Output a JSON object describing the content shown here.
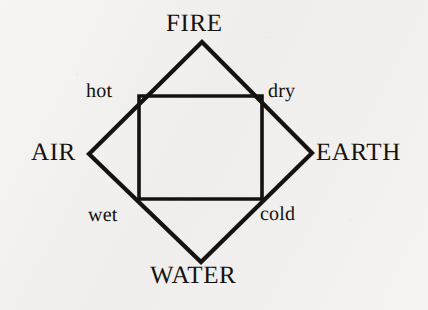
{
  "figure": {
    "background_color": "#f3f2f0",
    "ink_color": "#15120f"
  },
  "diagram": {
    "type": "diamond-in-square",
    "outer_shape": "diamond",
    "inner_shape": "square",
    "stroke_color": "#15120f",
    "outer_stroke_width": 4.2,
    "inner_stroke_width": 3.6,
    "outer_vertices": {
      "top": [
        202,
        42
      ],
      "right": [
        312,
        153
      ],
      "bottom": [
        201,
        262
      ],
      "left": [
        89,
        154
      ]
    },
    "inner_corners": {
      "top_left": [
        139,
        96
      ],
      "top_right": [
        262,
        96
      ],
      "bottom_right": [
        262,
        199
      ],
      "bottom_left": [
        139,
        199
      ]
    }
  },
  "elements": [
    {
      "id": "fire",
      "label": "FIRE",
      "position": "top"
    },
    {
      "id": "earth",
      "label": "EARTH",
      "position": "right"
    },
    {
      "id": "water",
      "label": "WATER",
      "position": "bottom"
    },
    {
      "id": "air",
      "label": "AIR",
      "position": "left"
    }
  ],
  "qualities": [
    {
      "id": "hot",
      "label": "hot",
      "position": "top-left"
    },
    {
      "id": "dry",
      "label": "dry",
      "position": "top-right"
    },
    {
      "id": "cold",
      "label": "cold",
      "position": "bottom-right"
    },
    {
      "id": "wet",
      "label": "wet",
      "position": "bottom-left"
    }
  ]
}
